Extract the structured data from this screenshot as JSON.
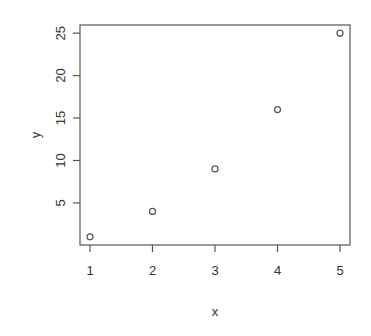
{
  "chart_data": {
    "type": "scatter",
    "title": "",
    "xlabel": "x",
    "ylabel": "y",
    "x": [
      1,
      2,
      3,
      4,
      5
    ],
    "y": [
      1,
      4,
      9,
      16,
      25
    ],
    "series": [
      {
        "name": "y",
        "x": [
          1,
          2,
          3,
          4,
          5
        ],
        "values": [
          1,
          4,
          9,
          16,
          25
        ]
      }
    ],
    "xticks": [
      1,
      2,
      3,
      4,
      5
    ],
    "yticks": [
      5,
      10,
      15,
      20,
      25
    ],
    "xlim": [
      0.84,
      5.16
    ],
    "ylim": [
      0.04,
      25.96
    ],
    "grid": false,
    "legend": null,
    "marker": "open-circle"
  },
  "colors": {
    "axis": "#555555",
    "marker": "#555555",
    "text": "#333333",
    "background": "#ffffff"
  },
  "labels": {
    "xticks": [
      "1",
      "2",
      "3",
      "4",
      "5"
    ],
    "yticks": [
      "5",
      "10",
      "15",
      "20",
      "25"
    ],
    "xlabel": "x",
    "ylabel": "y"
  }
}
